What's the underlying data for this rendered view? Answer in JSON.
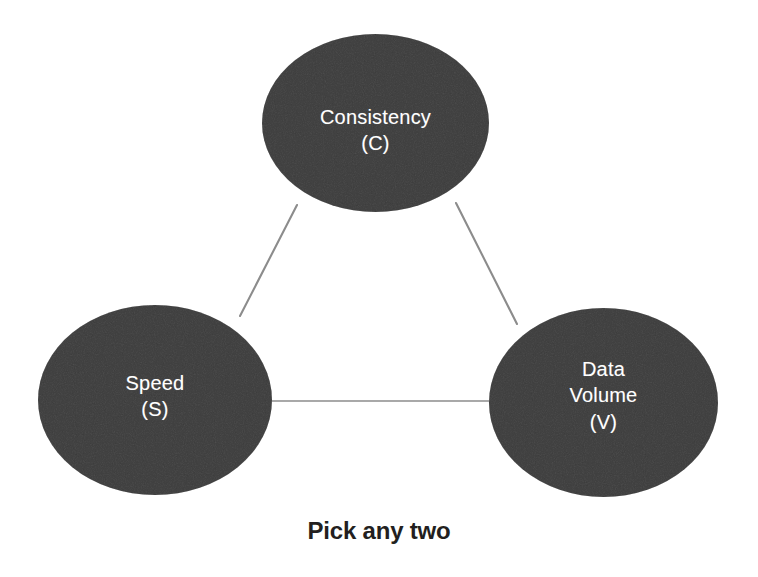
{
  "diagram": {
    "type": "venn-triangle-tradeoff",
    "caption": "Pick any two",
    "background_color": "#ffffff",
    "node_fill_color": "#808080",
    "node_text_color": "#ffffff",
    "edge_color": "#8c8c8c",
    "caption_color": "#231f20",
    "nodes": [
      {
        "id": "consistency",
        "label": "Consistency\n(C)",
        "name": "Consistency",
        "abbreviation": "C",
        "position": "top",
        "cx": 375.5,
        "cy": 123,
        "rx": 113.5,
        "ry": 89
      },
      {
        "id": "speed",
        "label": "Speed\n(S)",
        "name": "Speed",
        "abbreviation": "S",
        "position": "bottom-left",
        "cx": 155,
        "cy": 400,
        "rx": 117,
        "ry": 95
      },
      {
        "id": "data-volume",
        "label": "Data\nVolume\n(V)",
        "name": "Data Volume",
        "abbreviation": "V",
        "position": "bottom-right",
        "cx": 603.5,
        "cy": 402.5,
        "rx": 114.5,
        "ry": 94.5
      }
    ],
    "edges": [
      {
        "id": "edge-consistency-speed",
        "from": "consistency",
        "to": "speed",
        "x1": 297,
        "y1": 205,
        "x2": 240,
        "y2": 316
      },
      {
        "id": "edge-consistency-data-volume",
        "from": "consistency",
        "to": "data-volume",
        "x1": 456,
        "y1": 203,
        "x2": 517,
        "y2": 324
      },
      {
        "id": "edge-speed-data-volume",
        "from": "speed",
        "to": "data-volume",
        "x1": 271,
        "y1": 401,
        "x2": 490,
        "y2": 401
      }
    ]
  }
}
